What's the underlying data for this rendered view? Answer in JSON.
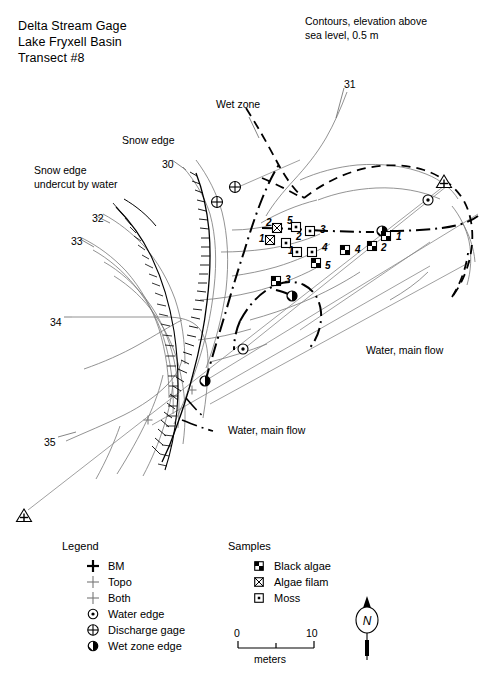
{
  "title": {
    "line1": "Delta Stream Gage",
    "line2": "Lake Fryxell Basin",
    "line3": "Transect #8"
  },
  "notes": {
    "contour_note_line1": "Contours, elevation above",
    "contour_note_line2": "sea level, 0.5 m",
    "snow_edge": "Snow edge",
    "snow_edge_undercut_line1": "Snow edge",
    "snow_edge_undercut_line2": "undercut by water",
    "wet_zone": "Wet zone",
    "water_main_flow_right": "Water, main flow",
    "water_main_flow_lower": "Water, main flow"
  },
  "contour_labels": [
    {
      "value": "31",
      "x": 344,
      "y": 78
    },
    {
      "value": "30",
      "x": 162,
      "y": 158
    },
    {
      "value": "32",
      "x": 92,
      "y": 212
    },
    {
      "value": "33",
      "x": 71,
      "y": 235
    },
    {
      "value": "34",
      "x": 50,
      "y": 316
    },
    {
      "value": "35",
      "x": 44,
      "y": 436
    }
  ],
  "sample_points": [
    {
      "label": "2",
      "type": "algae-filam",
      "x": 277,
      "y": 228,
      "lx": 266,
      "ly": 224
    },
    {
      "label": "1",
      "type": "algae-filam",
      "x": 270,
      "y": 240,
      "lx": 259,
      "ly": 240
    },
    {
      "label": "5",
      "type": "moss",
      "x": 296,
      "y": 227,
      "lx": 287,
      "ly": 222
    },
    {
      "label": "3",
      "type": "moss",
      "x": 310,
      "y": 231,
      "lx": 320,
      "ly": 231
    },
    {
      "label": "2",
      "type": "moss",
      "x": 286,
      "y": 243,
      "lx": 296,
      "ly": 238
    },
    {
      "label": "1",
      "type": "moss",
      "x": 297,
      "y": 252,
      "lx": 288,
      "ly": 252
    },
    {
      "label": "4",
      "type": "moss",
      "x": 312,
      "y": 252,
      "lx": 322,
      "ly": 249
    },
    {
      "label": "5",
      "type": "black-algae",
      "x": 316,
      "y": 263,
      "lx": 325,
      "ly": 267
    },
    {
      "label": "4",
      "type": "black-algae",
      "x": 345,
      "y": 250,
      "lx": 355,
      "ly": 251
    },
    {
      "label": "2",
      "type": "black-algae",
      "x": 372,
      "y": 246,
      "lx": 381,
      "ly": 249
    },
    {
      "label": "1",
      "type": "black-algae",
      "x": 386,
      "y": 236,
      "lx": 396,
      "ly": 238
    },
    {
      "label": "3",
      "type": "black-algae",
      "x": 276,
      "y": 281,
      "lx": 285,
      "ly": 281
    }
  ],
  "survey_markers": [
    {
      "type": "discharge-gage",
      "x": 235,
      "y": 187
    },
    {
      "type": "discharge-gage",
      "x": 217,
      "y": 202
    },
    {
      "type": "bm",
      "x": 444,
      "y": 182
    },
    {
      "type": "bm",
      "x": 24,
      "y": 516
    },
    {
      "type": "water-edge",
      "x": 428,
      "y": 200
    },
    {
      "type": "water-edge",
      "x": 243,
      "y": 349
    },
    {
      "type": "wet-zone-edge",
      "x": 382,
      "y": 231
    },
    {
      "type": "wet-zone-edge",
      "x": 292,
      "y": 296
    },
    {
      "type": "wet-zone-edge",
      "x": 205,
      "y": 381
    },
    {
      "type": "topo",
      "x": 148,
      "y": 420
    },
    {
      "type": "topo",
      "x": 192,
      "y": 390
    }
  ],
  "legend": {
    "heading": "Legend",
    "items": [
      {
        "symbol": "bm-icon",
        "label": "BM"
      },
      {
        "symbol": "topo-icon",
        "label": "Topo"
      },
      {
        "symbol": "both-icon",
        "label": "Both"
      },
      {
        "symbol": "water-edge-icon",
        "label": "Water edge"
      },
      {
        "symbol": "discharge-gage-icon",
        "label": "Discharge gage"
      },
      {
        "symbol": "wet-zone-edge-icon",
        "label": "Wet zone edge"
      }
    ]
  },
  "samples_legend": {
    "heading": "Samples",
    "items": [
      {
        "symbol": "black-algae-icon",
        "label": "Black algae"
      },
      {
        "symbol": "algae-filam-icon",
        "label": "Algae filam"
      },
      {
        "symbol": "moss-icon",
        "label": "Moss"
      }
    ]
  },
  "scale_bar": {
    "min": "0",
    "max": "10",
    "unit": "meters"
  },
  "north_arrow": {
    "label": "N"
  }
}
